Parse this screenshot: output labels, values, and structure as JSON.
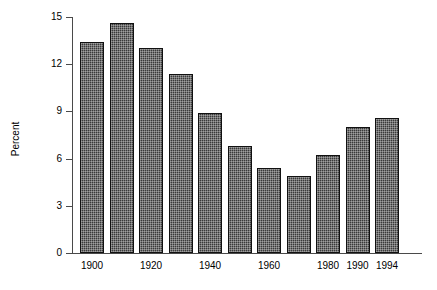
{
  "chart_data": {
    "type": "bar",
    "title": "",
    "subtitle": "",
    "xlabel": "",
    "ylabel": "Percent",
    "ylim": [
      0,
      15
    ],
    "yticks": [
      "0",
      "3",
      "6",
      "9",
      "12",
      "15"
    ],
    "ytick_values": [
      0,
      3,
      6,
      9,
      12,
      15
    ],
    "grid": false,
    "legend": null,
    "categories": [
      "1900",
      "1910",
      "1920",
      "1930",
      "1940",
      "1950",
      "1960",
      "1970",
      "1980",
      "1990",
      "1994"
    ],
    "bar_labels": [
      "1900",
      "1910",
      "1920",
      "1930",
      "1940",
      "1950",
      "1960",
      "1970",
      "1980",
      "1990",
      "1994"
    ],
    "visible_xticks": [
      "1900",
      "1920",
      "1940",
      "1960",
      "1980",
      "1990",
      "1994"
    ],
    "bars": [
      {
        "label": "1900",
        "value": 13.4,
        "tick_label": "1900"
      },
      {
        "label": "1910",
        "value": 14.6,
        "tick_label": ""
      },
      {
        "label": "1920",
        "value": 13.0,
        "tick_label": "1920"
      },
      {
        "label": "1930",
        "value": 11.4,
        "tick_label": ""
      },
      {
        "label": "1940",
        "value": 8.9,
        "tick_label": "1940"
      },
      {
        "label": "1950",
        "value": 6.8,
        "tick_label": ""
      },
      {
        "label": "1960",
        "value": 5.4,
        "tick_label": "1960"
      },
      {
        "label": "1970",
        "value": 4.9,
        "tick_label": ""
      },
      {
        "label": "1980",
        "value": 6.2,
        "tick_label": "1980"
      },
      {
        "label": "1990",
        "value": 8.0,
        "tick_label": "1990"
      },
      {
        "label": "1994",
        "value": 8.6,
        "tick_label": "1994"
      }
    ],
    "values": [
      13.4,
      14.6,
      13.0,
      11.4,
      8.9,
      6.8,
      5.4,
      4.9,
      6.2,
      8.0,
      8.6
    ],
    "colors": {
      "bar_fill": "#3a3a3a",
      "bar_edge": "#111111",
      "axis": "#4a4a4a",
      "text": "#000000",
      "background": "#ffffff"
    }
  }
}
